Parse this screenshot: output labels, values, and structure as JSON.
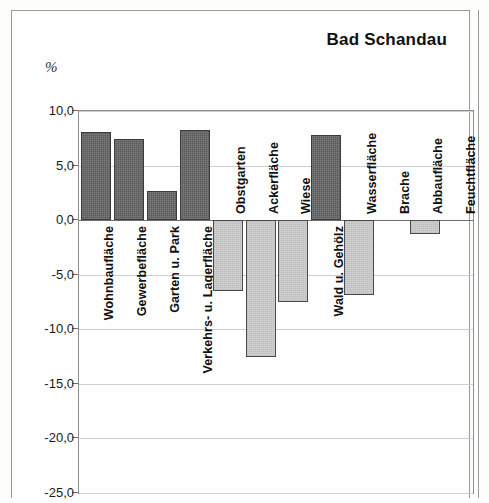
{
  "title": "Bad Schandau",
  "unit_label": "%",
  "colors": {
    "positive_bar": "#5a5a5a",
    "negative_bar": "#d2d2d2",
    "bar_outline": "#3b3b3b",
    "gridline": "#cfcfcf",
    "axis": "#6e6e6e",
    "frame": "#9a9a9a"
  },
  "chart_data": {
    "type": "bar",
    "title": "Bad Schandau",
    "xlabel": "",
    "ylabel": "%",
    "ylim": [
      -25.0,
      10.0
    ],
    "ytick_labels": [
      "10,0",
      "5,0",
      "0,0",
      "-5,0",
      "-10,0",
      "-15,0",
      "-20,0",
      "-25,0"
    ],
    "ytick_values": [
      10.0,
      5.0,
      0.0,
      -5.0,
      -10.0,
      -15.0,
      -20.0,
      -25.0
    ],
    "grid": true,
    "legend": "none",
    "categories": [
      "Wohnbaufläche",
      "Gewerbefläche",
      "Garten u. Park",
      "Verkehrs- u. Lagerfläche",
      "Obstgarten",
      "Ackerfläche",
      "Wiese",
      "Wald u. Gehölz",
      "Wasserfläche",
      "Brache",
      "Abbaufläche",
      "Feuchtfläche"
    ],
    "values": [
      8.1,
      7.4,
      2.7,
      8.3,
      -6.5,
      -12.5,
      -7.5,
      7.8,
      -6.9,
      0.0,
      -1.3,
      0.0
    ]
  }
}
